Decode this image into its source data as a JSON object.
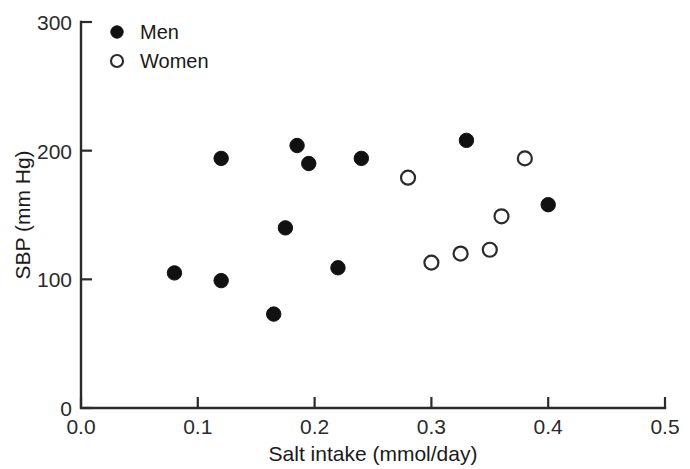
{
  "chart_data": {
    "type": "scatter",
    "title": "",
    "xlabel": "Salt intake (mmol/day)",
    "ylabel": "SBP (mm Hg)",
    "xlim": [
      0.0,
      0.5
    ],
    "ylim": [
      0,
      300
    ],
    "xticks": [
      0.0,
      0.1,
      0.2,
      0.3,
      0.4,
      0.5
    ],
    "xtick_labels": [
      "0.0",
      "0.1",
      "0.2",
      "0.3",
      "0.4",
      "0.5"
    ],
    "yticks": [
      0,
      100,
      200,
      300
    ],
    "ytick_labels": [
      "0",
      "100",
      "200",
      "300"
    ],
    "grid": false,
    "legend_position": "top-left",
    "series": [
      {
        "name": "Men",
        "marker": "filled-circle",
        "color": "#111111",
        "points": [
          {
            "x": 0.08,
            "y": 105
          },
          {
            "x": 0.12,
            "y": 194
          },
          {
            "x": 0.12,
            "y": 99
          },
          {
            "x": 0.165,
            "y": 73
          },
          {
            "x": 0.175,
            "y": 140
          },
          {
            "x": 0.185,
            "y": 204
          },
          {
            "x": 0.195,
            "y": 190
          },
          {
            "x": 0.22,
            "y": 109
          },
          {
            "x": 0.24,
            "y": 194
          },
          {
            "x": 0.33,
            "y": 208
          },
          {
            "x": 0.4,
            "y": 158
          }
        ]
      },
      {
        "name": "Women",
        "marker": "open-circle",
        "color": "#2b2b2b",
        "points": [
          {
            "x": 0.28,
            "y": 179
          },
          {
            "x": 0.3,
            "y": 113
          },
          {
            "x": 0.325,
            "y": 120
          },
          {
            "x": 0.35,
            "y": 123
          },
          {
            "x": 0.36,
            "y": 149
          },
          {
            "x": 0.38,
            "y": 194
          }
        ]
      }
    ]
  },
  "legend": {
    "entries": [
      {
        "label": "Men",
        "marker": "filled-circle"
      },
      {
        "label": "Women",
        "marker": "open-circle"
      }
    ]
  }
}
